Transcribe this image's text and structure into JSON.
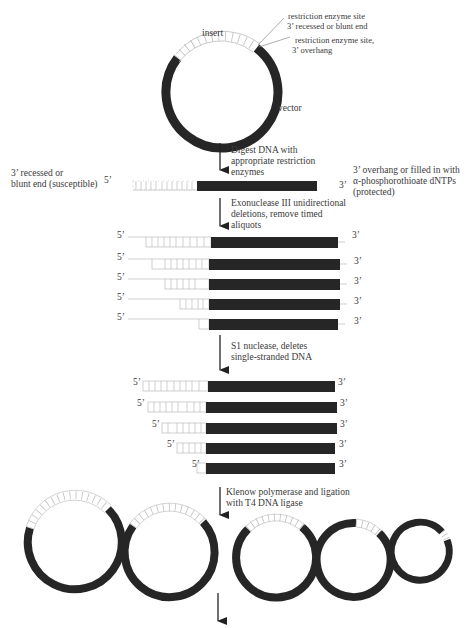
{
  "plasmid": {
    "insert_label": "insert",
    "vector_label": "vector",
    "site1_line1": "restriction enzyme site",
    "site1_line2": "3’ recessed or blunt end",
    "site2_line1": "restriction enzyme site,",
    "site2_line2": "3’ overhang"
  },
  "steps": [
    {
      "line1": "Digest DNA with",
      "line2": "appropriate restriction",
      "line3": "enzymes"
    },
    {
      "line1": "Exonuclease III unidirectional",
      "line2": "deletions, remove timed",
      "line3": "aliquots"
    },
    {
      "line1": "S1 nuclease, deletes",
      "line2": "single-stranded DNA"
    },
    {
      "line1": "Klenow polymerase and ligation",
      "line2": "with T4 DNA ligase"
    }
  ],
  "linear": {
    "left_line1": "3’ recessed or",
    "left_line2": "blunt end (susceptible)",
    "left_end": "5’",
    "right_end": "3’",
    "right_line1": "3’ overhang or filled in with",
    "right_line2": "α-phosphorothioate dNTPs",
    "right_line3": "(protected)"
  },
  "ends": {
    "five": "5’",
    "three": "3’"
  },
  "colors": {
    "vector": "#262626",
    "insert_stroke": "#bdbdbd",
    "arrow": "#222222",
    "text": "#3a3a3a"
  }
}
